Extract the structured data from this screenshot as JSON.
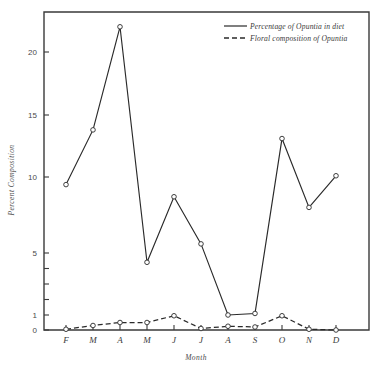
{
  "chart_data": {
    "type": "line",
    "title": "",
    "xlabel": "Month",
    "ylabel": "Percent Composition",
    "categories": [
      "F",
      "M",
      "A",
      "M",
      "J",
      "J",
      "A",
      "S",
      "O",
      "N",
      "D"
    ],
    "x": [
      1,
      2,
      3,
      4,
      5,
      6,
      7,
      8,
      9,
      10,
      11
    ],
    "series": [
      {
        "name": "Percentage of Opuntia in diet",
        "style": "solid",
        "marker": "open-circle",
        "values": [
          9.5,
          13.8,
          22.0,
          4.4,
          8.7,
          5.6,
          1.0,
          1.1,
          13.1,
          8.0,
          10.1
        ]
      },
      {
        "name": "Floral composition of Opuntia",
        "style": "dashed",
        "marker": "open-circle",
        "values": [
          0.05,
          0.3,
          0.5,
          0.5,
          0.95,
          0.1,
          0.25,
          0.2,
          0.95,
          0.05,
          0.0
        ]
      }
    ],
    "yticks": [
      0,
      1,
      2,
      3,
      4,
      5,
      10,
      15,
      20
    ],
    "ytick_labels": [
      "0",
      "1",
      "",
      "",
      "",
      "5",
      "10",
      "15",
      "20"
    ],
    "ylim": [
      0,
      22.8
    ],
    "yscale": "piecewise-expanded-below-5",
    "grid": false,
    "legend_position": "top-right",
    "legend": [
      "Percentage of Opuntia in diet",
      "Floral composition of Opuntia"
    ]
  },
  "axes": {
    "y_title": "Percent Composition",
    "x_title": "Month"
  },
  "colors": {
    "line": "#2a2a2a",
    "axis": "#3a3a3a",
    "background": "#ffffff",
    "marker_fill": "#ffffff"
  }
}
